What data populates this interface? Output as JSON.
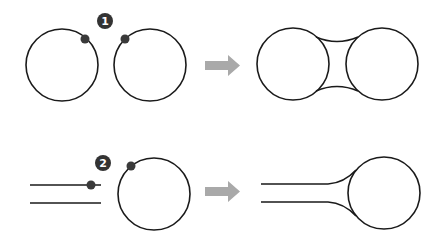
{
  "diagram": {
    "colors": {
      "stroke": "#1a1a1a",
      "dot": "#3a3a3a",
      "badge": "#333333",
      "arrow": "#a9a9a9",
      "background": "#ffffff"
    },
    "steps": [
      {
        "badge": "1",
        "before": "two separate circles, each with a contact dot",
        "after": "two circles joined by a concave neck"
      },
      {
        "badge": "2",
        "before": "a pair of parallel lines with a dot, and a circle with a dot",
        "after": "parallel lines flaring into a circle"
      }
    ]
  }
}
